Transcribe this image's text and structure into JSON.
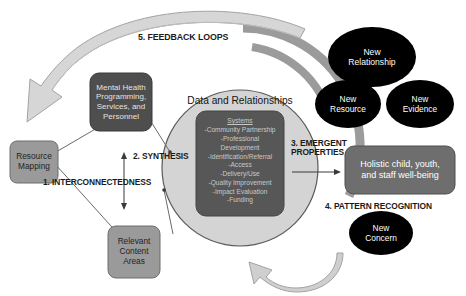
{
  "diagram": {
    "title_center_circle": "Data and Relationships",
    "process_labels": [
      {
        "id": "interconnectedness",
        "text": "1. INTERCONNECTEDNESS"
      },
      {
        "id": "synthesis",
        "text": "2. SYNTHESIS"
      },
      {
        "id": "emergent-properties",
        "text": "3. EMERGENT\nPROPERTIES"
      },
      {
        "id": "pattern-recognition",
        "text": "4. PATTERN RECOGNITION"
      },
      {
        "id": "feedback-loops",
        "text": "5. FEEDBACK LOOPS"
      }
    ],
    "boxes": [
      {
        "id": "resource-mapping",
        "text": "Resource\nMapping",
        "fill": "#9a9a9a",
        "text_color": "#1f1f1f"
      },
      {
        "id": "mental-health",
        "text": "Mental Health\nProgramming,\nServices, and\nPersonnel",
        "fill": "#4e4e4e",
        "text_color": "#e8e8e8"
      },
      {
        "id": "relevant-content",
        "text": "Relevant\nContent\nAreas",
        "fill": "#9a9a9a",
        "text_color": "#1f1f1f"
      },
      {
        "id": "holistic-wellbeing",
        "text": "Holistic child, youth,\nand staff well-being",
        "fill": "#6e6e6e",
        "text_color": "#ffffff"
      }
    ],
    "center_box": {
      "id": "systems-list",
      "heading": "Systems",
      "items": [
        "-Community Partnership",
        "-Professional",
        "Development",
        "-Identification/Referral",
        "-Access",
        "-Delivery/Use",
        "-Quality Improvement",
        "-Impact Evaluation",
        "-Funding"
      ],
      "fill": "#575757",
      "text_color": "#cfcfcf"
    },
    "ellipses": [
      {
        "id": "new-relationship",
        "text": "New\nRelationship",
        "fill": "#000000",
        "text_color": "#ffffff"
      },
      {
        "id": "new-resource",
        "text": "New\nResource",
        "fill": "#000000",
        "text_color": "#ffffff"
      },
      {
        "id": "new-evidence",
        "text": "New\nEvidence",
        "fill": "#000000",
        "text_color": "#ffffff"
      },
      {
        "id": "new-concern",
        "text": "New\nConcern",
        "fill": "#000000",
        "text_color": "#ffffff"
      }
    ],
    "colors": {
      "circle_fill": "#d4d4d4",
      "circle_stroke": "#5a5a5a",
      "arc_gray": "#9b9b9b",
      "arrow_fill": "#d6d6d6",
      "arrow_stroke": "#8f8f8f",
      "connector": "#6a6a6a"
    }
  }
}
